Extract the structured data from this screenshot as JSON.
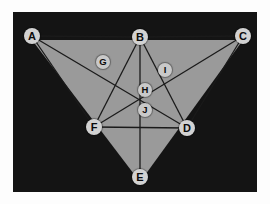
{
  "figure": {
    "title": "",
    "background_color": "#141414",
    "fill_color": "#9a9a9a",
    "line_color": "#1a1a1a",
    "node_fill": "#d2d2d2",
    "node_text_color": "#0b0b0b",
    "frame": {
      "x": 13,
      "y": 12,
      "width": 244,
      "height": 180
    }
  },
  "nodes": [
    {
      "id": "A",
      "label": "A",
      "x": 19,
      "y": 24,
      "size": "large"
    },
    {
      "id": "B",
      "label": "B",
      "x": 127,
      "y": 25,
      "size": "large"
    },
    {
      "id": "C",
      "label": "C",
      "x": 230,
      "y": 24,
      "size": "large"
    },
    {
      "id": "D",
      "label": "D",
      "x": 174,
      "y": 116,
      "size": "large"
    },
    {
      "id": "E",
      "label": "E",
      "x": 127,
      "y": 165,
      "size": "large"
    },
    {
      "id": "F",
      "label": "F",
      "x": 81,
      "y": 115,
      "size": "large"
    },
    {
      "id": "G",
      "label": "G",
      "x": 90,
      "y": 50,
      "size": "small"
    },
    {
      "id": "H",
      "label": "H",
      "x": 132,
      "y": 78,
      "size": "small"
    },
    {
      "id": "I",
      "label": "I",
      "x": 152,
      "y": 58,
      "size": "small"
    },
    {
      "id": "J",
      "label": "J",
      "x": 132,
      "y": 98,
      "size": "small"
    }
  ],
  "filled_polygon": {
    "name": "triangle-ACE",
    "points": "19,28 230,28 127,170"
  },
  "edges": [
    {
      "from": "A",
      "to": "B",
      "name": "edge-a-b"
    },
    {
      "from": "B",
      "to": "C",
      "name": "edge-b-c"
    },
    {
      "from": "A",
      "to": "D",
      "name": "edge-a-d"
    },
    {
      "from": "C",
      "to": "F",
      "name": "edge-c-f"
    },
    {
      "from": "B",
      "to": "F",
      "name": "edge-b-f"
    },
    {
      "from": "B",
      "to": "D",
      "name": "edge-b-d"
    },
    {
      "from": "B",
      "to": "E",
      "name": "edge-b-e"
    },
    {
      "from": "F",
      "to": "D",
      "name": "edge-f-d"
    },
    {
      "from": "A",
      "to": "F",
      "name": "edge-a-f"
    },
    {
      "from": "C",
      "to": "D",
      "name": "edge-c-d"
    }
  ]
}
